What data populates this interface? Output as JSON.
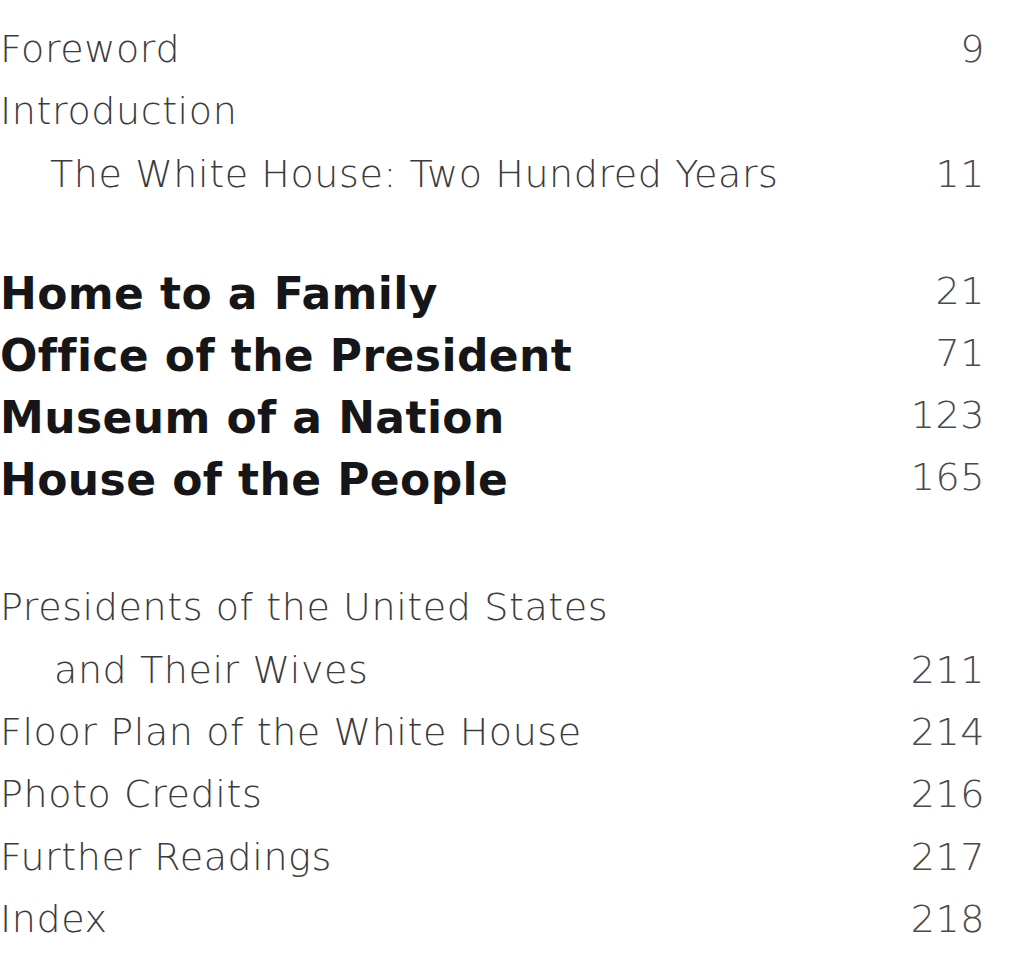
{
  "document": {
    "type": "table-of-contents",
    "background_color": "#ffffff",
    "light_text_color": "#3b3b3d",
    "bold_text_color": "#161618",
    "page_number_color": "#4a4a4c"
  },
  "front_matter": [
    {
      "title": "Foreword",
      "page": "9",
      "indent": 0,
      "style": "light",
      "top": 30
    },
    {
      "title": "Introduction",
      "page": "",
      "indent": 0,
      "style": "light",
      "top": 92
    },
    {
      "title": "The White House: Two Hundred Years",
      "page": "11",
      "indent": 1,
      "style": "light",
      "top": 155
    }
  ],
  "parts": [
    {
      "title": "Home to a Family",
      "page": "21",
      "indent": 0,
      "style": "bold",
      "top": 272
    },
    {
      "title": "Office of the President",
      "page": "71",
      "indent": 0,
      "style": "bold",
      "top": 334
    },
    {
      "title": "Museum of a Nation",
      "page": "123",
      "indent": 0,
      "style": "bold",
      "top": 396
    },
    {
      "title": "House of the People",
      "page": "165",
      "indent": 0,
      "style": "bold",
      "top": 458
    }
  ],
  "back_matter": [
    {
      "title": "Presidents of the United States",
      "page": "",
      "indent": 0,
      "style": "light",
      "top": 588
    },
    {
      "title": "and Their Wives",
      "page": "211",
      "indent": 2,
      "style": "light",
      "top": 651
    },
    {
      "title": "Floor Plan of the White House",
      "page": "214",
      "indent": 0,
      "style": "light",
      "top": 713
    },
    {
      "title": "Photo Credits",
      "page": "216",
      "indent": 0,
      "style": "light",
      "top": 775
    },
    {
      "title": "Further Readings",
      "page": "217",
      "indent": 0,
      "style": "light",
      "top": 838
    },
    {
      "title": "Index",
      "page": "218",
      "indent": 0,
      "style": "light",
      "top": 900
    }
  ]
}
